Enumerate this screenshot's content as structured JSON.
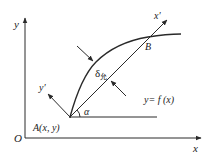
{
  "diagram": {
    "title": "",
    "axes": {
      "x_label": "x",
      "y_label": "y",
      "origin_label": "O"
    },
    "rotated_axes": {
      "x_prime_label": "x′",
      "y_prime_label": "y′"
    },
    "points": {
      "A_label": "A(x, y)",
      "B_label": "B"
    },
    "angle_label": "α",
    "deviation": {
      "symbol": "δ",
      "subscript": "允"
    },
    "curve_label": "y= f (x)",
    "colors": {
      "stroke": "#2a2a2a",
      "text": "#222222",
      "background": "#ffffff"
    }
  }
}
